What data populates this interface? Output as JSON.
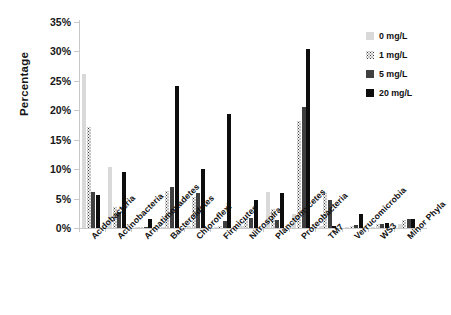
{
  "chart_data": {
    "type": "bar",
    "title": "",
    "xlabel": "",
    "ylabel": "Percentage",
    "ylim": [
      0,
      35
    ],
    "ytick_labels": [
      "0%",
      "5%",
      "10%",
      "15%",
      "20%",
      "25%",
      "30%",
      "35%"
    ],
    "ytick_values": [
      0,
      5,
      10,
      15,
      20,
      25,
      30,
      35
    ],
    "grid": false,
    "legend_position": "right",
    "categories": [
      "Acidobacteria",
      "Actinobacteria",
      "Armatimonadetes",
      "Bacteroidetes",
      "Chloroflexi",
      "Firmicutes",
      "Nitrospira",
      "Planctomycetes",
      "Proteobacteria",
      "TM7",
      "Verrucomicrobia",
      "WS3",
      "Minor Phyla"
    ],
    "series": [
      {
        "name": "0 mg/L",
        "color": "#d9d9d9",
        "values": [
          26.2,
          10.4,
          0.1,
          0.2,
          0.3,
          0.2,
          0.3,
          6.1,
          2.3,
          0.3,
          0.2,
          0.2,
          0.6
        ]
      },
      {
        "name": "1 mg/L",
        "color": "#f2f2f2",
        "pattern": "dotted",
        "values": [
          17.2,
          3.6,
          0.2,
          6.3,
          5.2,
          0.3,
          1.5,
          3.2,
          18.2,
          5.9,
          0.3,
          0.6,
          1.3
        ]
      },
      {
        "name": "5 mg/L",
        "color": "#3f3f3f",
        "values": [
          6.1,
          2.7,
          0.2,
          6.9,
          6.0,
          1.2,
          1.7,
          1.4,
          20.5,
          4.8,
          0.5,
          0.7,
          1.6
        ]
      },
      {
        "name": "20 mg/L",
        "color": "#0d0d0d",
        "values": [
          5.6,
          9.6,
          1.5,
          24.2,
          10.0,
          19.4,
          4.7,
          6.0,
          30.5,
          0.4,
          2.3,
          0.9,
          1.5
        ]
      }
    ]
  },
  "legend": {
    "items": [
      {
        "label": "0 mg/L"
      },
      {
        "label": "1 mg/L"
      },
      {
        "label": "5 mg/L"
      },
      {
        "label": "20 mg/L"
      }
    ]
  }
}
